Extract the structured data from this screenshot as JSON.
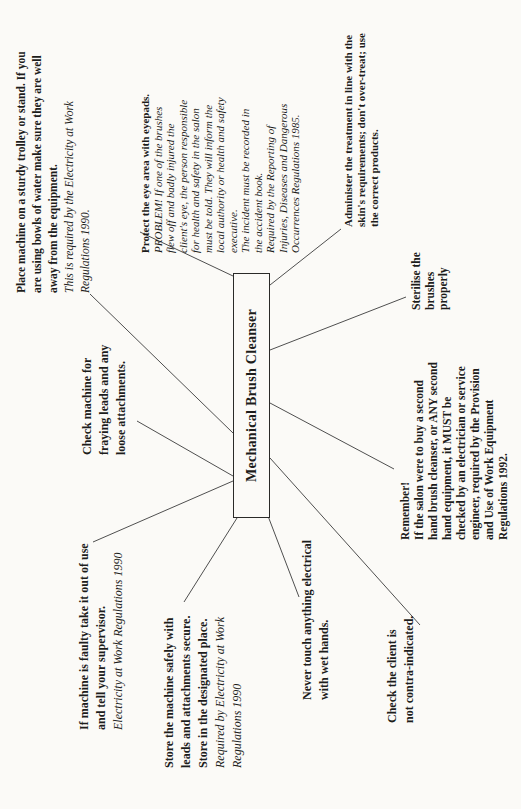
{
  "colors": {
    "paper": "#fbfaf7",
    "ink": "#1d1d1b",
    "line": "#4f4f4f"
  },
  "center": {
    "label": "Mechanical Brush Cleanser"
  },
  "nodes": {
    "place_machine": {
      "lines": [
        {
          "text": "Place machine on a sturdy trolley or stand. If you",
          "style": "bold"
        },
        {
          "text": "are using bowls of water make sure they are well",
          "style": "bold"
        },
        {
          "text": "away from the equipment.",
          "style": "bold"
        },
        {
          "text": "This is required by the Electricity at Work",
          "style": "italic"
        },
        {
          "text": "Regulations 1990.",
          "style": "italic"
        }
      ]
    },
    "protect_eye": {
      "lines": [
        {
          "text": "Protect the eye area with eyepads.",
          "style": "bold"
        },
        {
          "text": "PROBLEM! If one of the brushes",
          "style": "italic"
        },
        {
          "text": "flew off and badly injured the",
          "style": "italic"
        },
        {
          "text": "client's eye, the person responsible",
          "style": "italic"
        },
        {
          "text": "for health and safety in the salon",
          "style": "italic"
        },
        {
          "text": "must be told. They will inform the",
          "style": "italic"
        },
        {
          "text": "local authority or health and safety",
          "style": "italic"
        },
        {
          "text": "executive.",
          "style": "italic"
        },
        {
          "text": "The incident must be recorded in",
          "style": "italic"
        },
        {
          "text": "the accident book.",
          "style": "italic"
        },
        {
          "text": "Required by the Reporting of",
          "style": "italic"
        },
        {
          "text": "Injuries, Diseases and Dangerous",
          "style": "italic"
        },
        {
          "text": "Occurrences Regulations 1985.",
          "style": "italic"
        }
      ]
    },
    "administer": {
      "lines": [
        {
          "text": "Administer the treatment in line with the",
          "style": "bold"
        },
        {
          "text": "skin's requirements; don't over-treat; use",
          "style": "bold"
        },
        {
          "text": "the correct products.",
          "style": "bold"
        }
      ]
    },
    "sterilise": {
      "lines": [
        {
          "text": "Sterilise the",
          "style": "bold"
        },
        {
          "text": "brushes",
          "style": "bold"
        },
        {
          "text": "properly",
          "style": "bold"
        }
      ]
    },
    "check_fraying": {
      "lines": [
        {
          "text": "Check machine for",
          "style": "bold"
        },
        {
          "text": "fraying leads and any",
          "style": "bold"
        },
        {
          "text": "loose attachments.",
          "style": "bold"
        }
      ]
    },
    "remember": {
      "lines": [
        {
          "text": "Remember!",
          "style": "bold"
        },
        {
          "text": "If the salon were to buy a second",
          "style": "bold"
        },
        {
          "text": "hand brush cleanser, or ANY second",
          "style": "bold"
        },
        {
          "text": "hand equipment, it MUST be",
          "style": "bold"
        },
        {
          "text": "checked by an electrician or service",
          "style": "bold"
        },
        {
          "text": "engineer, required by the Provision",
          "style": "bold"
        },
        {
          "text": "and Use of Work Equipment",
          "style": "bold"
        },
        {
          "text": "Regulations 1992.",
          "style": "bold"
        }
      ]
    },
    "check_client": {
      "lines": [
        {
          "text": "Check the client is",
          "style": "bold"
        },
        {
          "text": "not contra-indicated.",
          "style": "bold"
        }
      ]
    },
    "never_touch": {
      "lines": [
        {
          "text": "Never touch anything electrical",
          "style": "bold"
        },
        {
          "text": "with wet hands.",
          "style": "bold"
        }
      ]
    },
    "store_machine": {
      "lines": [
        {
          "text": "Store the machine safely with",
          "style": "bold"
        },
        {
          "text": "leads and attachments secure.",
          "style": "bold"
        },
        {
          "text": "Store in the designated place.",
          "style": "bold"
        },
        {
          "text": "Required by Electricity at Work",
          "style": "italic"
        },
        {
          "text": "Regulations 1990",
          "style": "italic"
        }
      ]
    },
    "if_faulty": {
      "lines": [
        {
          "text": "If machine is faulty take it out of use",
          "style": "bold"
        },
        {
          "text": "and tell your supervisor.",
          "style": "bold"
        },
        {
          "text": "Electricity at Work Regulations 1990",
          "style": "italic"
        }
      ]
    }
  },
  "connections": [
    {
      "from": "center",
      "to": "place_machine"
    },
    {
      "from": "center",
      "to": "protect_eye"
    },
    {
      "from": "center",
      "to": "administer"
    },
    {
      "from": "center",
      "to": "sterilise"
    },
    {
      "from": "center",
      "to": "check_fraying"
    },
    {
      "from": "center",
      "to": "remember"
    },
    {
      "from": "center",
      "to": "check_client"
    },
    {
      "from": "center",
      "to": "never_touch"
    },
    {
      "from": "center",
      "to": "store_machine"
    },
    {
      "from": "center",
      "to": "if_faulty"
    }
  ]
}
